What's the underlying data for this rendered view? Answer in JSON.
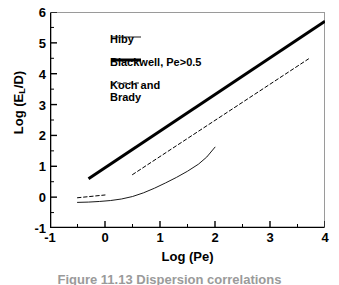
{
  "chart_data": {
    "type": "line",
    "title": "",
    "xlabel": "Log (Pe)",
    "ylabel": "Log (EL/D)",
    "ylabel_base": "Log (E",
    "ylabel_sub": "L",
    "ylabel_tail": "/D)",
    "xlim": [
      -1,
      4
    ],
    "ylim": [
      -1,
      6
    ],
    "xticks": [
      -1,
      0,
      1,
      2,
      3,
      4
    ],
    "yticks": [
      -1,
      0,
      1,
      2,
      3,
      4,
      5,
      6
    ],
    "xtick_labels": [
      "-1",
      "0",
      "1",
      "2",
      "3",
      "4"
    ],
    "ytick_labels": [
      "-1",
      "0",
      "1",
      "2",
      "3",
      "4",
      "5",
      "6"
    ],
    "x_minor_ticks": [
      -0.5,
      0.5,
      1.5,
      2.5,
      3.5
    ],
    "y_minor_ticks": [
      -0.5,
      0.5,
      1.5,
      2.5,
      3.5,
      4.5,
      5.5
    ],
    "grid": false,
    "legend_position": "upper-left-inside",
    "series": [
      {
        "name": "Hiby",
        "style": "thin-solid",
        "color": "#000000",
        "width": 0.9,
        "points": [
          [
            -0.5,
            -0.17
          ],
          [
            -0.3,
            -0.16
          ],
          [
            -0.1,
            -0.14
          ],
          [
            0.1,
            -0.11
          ],
          [
            0.3,
            -0.06
          ],
          [
            0.5,
            0.02
          ],
          [
            0.7,
            0.14
          ],
          [
            0.9,
            0.29
          ],
          [
            1.1,
            0.46
          ],
          [
            1.3,
            0.64
          ],
          [
            1.5,
            0.84
          ],
          [
            1.7,
            1.07
          ],
          [
            1.85,
            1.3
          ],
          [
            2.0,
            1.62
          ]
        ]
      },
      {
        "name": "Blackwell, Pe>0.5",
        "style": "thick-solid",
        "color": "#000000",
        "width": 3.0,
        "points": [
          [
            -0.3,
            0.6
          ],
          [
            4.0,
            5.7
          ]
        ]
      },
      {
        "name": "Koch and\nBrady",
        "style": "dashed",
        "color": "#000000",
        "width": 1.0,
        "segments": [
          [
            [
              -0.5,
              -0.02
            ],
            [
              0.0,
              0.07
            ]
          ],
          [
            [
              0.5,
              0.73
            ],
            [
              3.7,
              4.48
            ]
          ]
        ]
      }
    ]
  },
  "legend": {
    "entries": [
      {
        "label": "Hiby",
        "swatch": "thin-solid-swatch"
      },
      {
        "label": "Blackwell, Pe>0.5",
        "swatch": "thick-solid-swatch"
      },
      {
        "label": "Koch and\nBrady",
        "swatch": "dashed-swatch"
      }
    ]
  },
  "caption": "Figure 11.13   Dispersion correlations"
}
